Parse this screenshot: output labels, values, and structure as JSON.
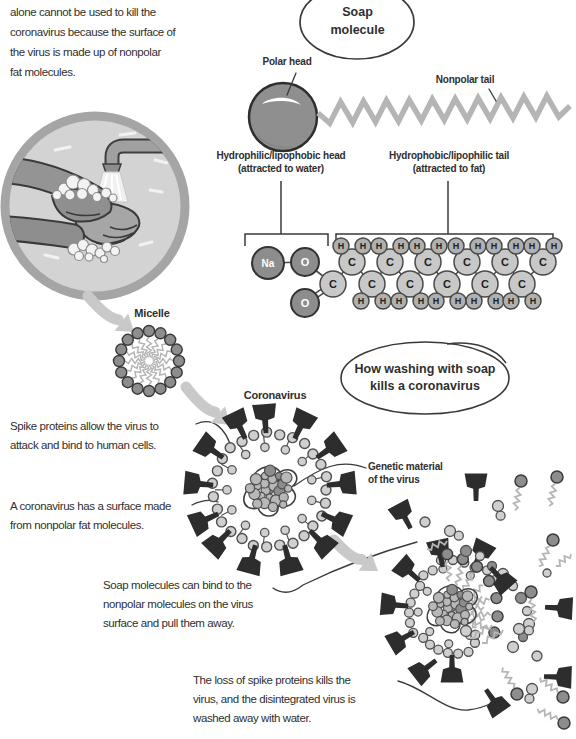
{
  "palette": {
    "ink": "#2f2f2f",
    "line_dark": "#3a3a3a",
    "arrow": "#c9c9c9",
    "spike": "#2d2d2d",
    "head_dark": "#8d8d8d",
    "bead_light": "#cfcfcf",
    "bead_core": "#b8b8b8",
    "tail_gray": "#b5b5b5",
    "atom_dark": "#8d8d8d",
    "atom_light": "#c8c8c8",
    "atom_h": "#b0b0b0",
    "background": "#ffffff"
  },
  "intro_paragraph": "alone cannot be used to kill the\ncoronavirus because the surface of\nthe virus is made up of nonpolar\nfat molecules.",
  "callouts": {
    "soap_molecule": "Soap\nmolecule",
    "how_washing": "How washing with soap\nkills a coronavirus"
  },
  "labels": {
    "polar_head": "Polar head",
    "nonpolar_tail": "Nonpolar tail",
    "hydrophilic_head": "Hydrophilic/lipophobic head\n(attracted to water)",
    "hydrophobic_tail": "Hydrophobic/lipophilic tail\n(attracted to fat)",
    "micelle": "Micelle",
    "coronavirus": "Coronavirus",
    "genetic_material": "Genetic material\nof the virus"
  },
  "annotations": {
    "spike_proteins": "Spike proteins allow the virus to\nattack and bind to human cells.",
    "nonpolar_surface": "A coronavirus has a surface made\nfrom nonpolar fat molecules.",
    "soap_binds": "Soap molecules can bind to the\nnonpolar molecules on the virus\nsurface and pull them away.",
    "loss_of_spikes": "The loss of spike proteins kills the\nvirus, and the disintegrated virus is\nwashed away with water."
  },
  "molecule": {
    "head_atoms": [
      {
        "symbol": "Na",
        "x": 268,
        "y": 263,
        "r": 16,
        "type": "dark"
      },
      {
        "symbol": "O",
        "x": 305,
        "y": 262,
        "r": 14,
        "type": "dark"
      },
      {
        "symbol": "C",
        "x": 333,
        "y": 284,
        "r": 13,
        "type": "light"
      },
      {
        "symbol": "O",
        "x": 305,
        "y": 303,
        "r": 14,
        "type": "dark"
      }
    ],
    "chain": {
      "c_symbol": "C",
      "h_symbol": "H",
      "top_xs": [
        352,
        390,
        428,
        467,
        505,
        543
      ],
      "bottom_xs": [
        372,
        410,
        447,
        485,
        522
      ],
      "top_y": 262,
      "bottom_y": 284,
      "h_top_y": 246,
      "h_bottom_y": 301
    }
  }
}
